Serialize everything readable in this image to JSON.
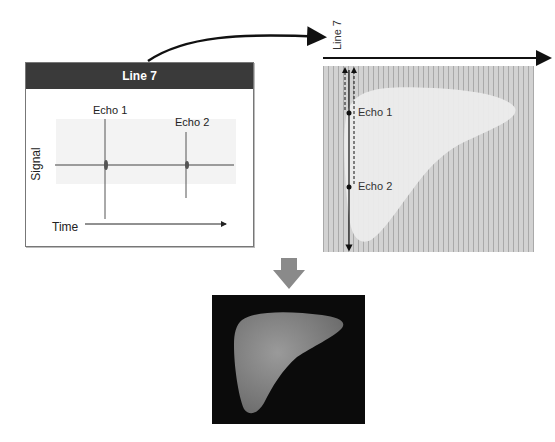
{
  "figure": {
    "left_panel": {
      "title": "Line 7",
      "y_label": "Signal",
      "x_label": "Time",
      "echo_labels": [
        "Echo 1",
        "Echo 2"
      ]
    },
    "right_panel": {
      "scan_line_label": "Line 7",
      "echo_labels": [
        "Echo 1",
        "Echo 2"
      ]
    },
    "colors": {
      "panel_header": "#3a3a3a",
      "grid_bg": "#cfcfcf",
      "grid_line": "#a9a9a9",
      "organ_fill": "#e8e8e8",
      "down_arrow": "#8a8a8a",
      "ultrasound_bg": "#0b0b0b",
      "ultrasound_organ": "#7d7d7d"
    }
  }
}
